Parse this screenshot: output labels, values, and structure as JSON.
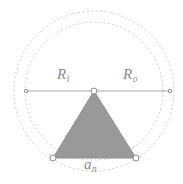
{
  "figure": {
    "background_color": "#ffffff",
    "width": 183,
    "height": 184,
    "center": {
      "x": 94,
      "y": 91
    },
    "labels": {
      "inradius": {
        "symbol": "R",
        "subscript": "i",
        "text": "Ri"
      },
      "circumradius": {
        "symbol": "R",
        "subscript": "o",
        "text": "Ro"
      },
      "side_length": {
        "symbol": "a",
        "subscript": "n",
        "text": "an"
      }
    },
    "colors": {
      "polygon_fill": "#999999",
      "polygon_stroke": "#8f8f8f",
      "circle_stroke": "#c9c9c9",
      "diameter_line": "#a8a8a8",
      "vertex_marker_fill": "#ffffff",
      "vertex_marker_stroke": "#8a8a8a",
      "label_text": "#8a8a8a"
    },
    "circles": {
      "outer": {
        "name": "circumscribed-circle",
        "cx": 94,
        "cy": 91,
        "r": 80,
        "style": "dotted"
      },
      "inner": {
        "name": "inscribed-circle",
        "cx": 94,
        "cy": 91,
        "r": 69,
        "style": "dotted"
      }
    },
    "diameter": {
      "name": "horizontal-diameter",
      "x1": 26,
      "y1": 91,
      "x2": 170,
      "y2": 91
    },
    "polygon": {
      "name": "equilateral-triangle",
      "sides": 3,
      "points": "94,91 53,158 136,158"
    },
    "markers": [
      {
        "name": "apex-vertex-marker",
        "cx": 94,
        "cy": 91,
        "r": 3
      },
      {
        "name": "bottom-left-vertex-marker",
        "cx": 53,
        "cy": 158,
        "r": 3
      },
      {
        "name": "bottom-right-vertex-marker",
        "cx": 136,
        "cy": 158,
        "r": 3
      },
      {
        "name": "diameter-left-endpoint-marker",
        "cx": 26,
        "cy": 91,
        "r": 1.7
      },
      {
        "name": "diameter-right-endpoint-marker",
        "cx": 170,
        "cy": 91,
        "r": 1.7
      }
    ]
  }
}
